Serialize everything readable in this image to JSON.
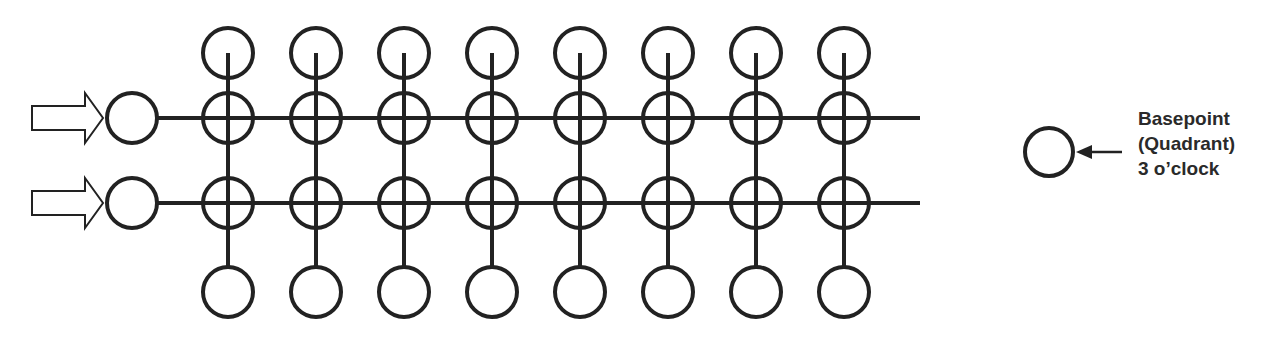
{
  "diagram": {
    "title": "",
    "colors": {
      "stroke": "#222222",
      "background": "#ffffff"
    },
    "grid": {
      "columns": 8,
      "rows": 2,
      "column_x": [
        228,
        316,
        404,
        492,
        580,
        668,
        756,
        844
      ],
      "row_y": [
        118,
        203
      ],
      "top_circle_y": 53,
      "bottom_circle_y": 292,
      "circle_radius": 25
    },
    "inputs": [
      {
        "name": "input-row-1",
        "arrow_icon": "hollow-right-arrow-icon",
        "basepoint_y": 118
      },
      {
        "name": "input-row-2",
        "arrow_icon": "hollow-right-arrow-icon",
        "basepoint_y": 203
      }
    ],
    "legend": {
      "symbol": "circle-icon",
      "pointer": "left-arrow-icon",
      "lines": [
        "Basepoint",
        "(Quadrant)",
        "3 o’clock"
      ]
    }
  }
}
